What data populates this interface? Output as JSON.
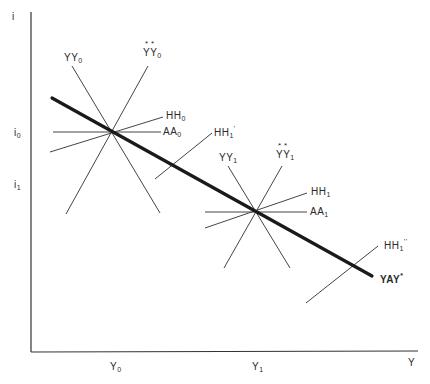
{
  "diagram": {
    "axes": {
      "y_label": "i",
      "x_label": "Y",
      "y_ticks": [
        {
          "base": "i",
          "sub": "0"
        },
        {
          "base": "i",
          "sub": "1"
        }
      ],
      "x_ticks": [
        {
          "base": "Y",
          "sub": "0"
        },
        {
          "base": "Y",
          "sub": "1"
        }
      ]
    },
    "curves": {
      "YY0": {
        "base": "YY",
        "sub": "0",
        "mark": ""
      },
      "YYstar0": {
        "base": "YY",
        "sub": "0",
        "mark": "**"
      },
      "HH0": {
        "base": "HH",
        "sub": "0",
        "mark": ""
      },
      "AA0": {
        "base": "AA",
        "sub": "0",
        "mark": ""
      },
      "HHprime1": {
        "base": "HH",
        "sub": "1",
        "mark": "'"
      },
      "YY1": {
        "base": "YY",
        "sub": "1",
        "mark": ""
      },
      "YYstar1": {
        "base": "YY",
        "sub": "1",
        "mark": "**"
      },
      "HH1": {
        "base": "HH",
        "sub": "1",
        "mark": ""
      },
      "AA1": {
        "base": "AA",
        "sub": "1",
        "mark": ""
      },
      "HHdoubleprime1": {
        "base": "HH",
        "sub": "1",
        "mark": "''"
      },
      "YAY": {
        "base": "YAY",
        "mark": "*"
      }
    }
  }
}
